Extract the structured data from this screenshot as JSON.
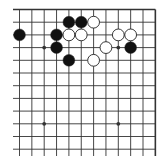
{
  "board": {
    "description": "Go board corner diagram (top-right region of a 19x19 board)",
    "columns": 12,
    "rows": 12,
    "open_left": true,
    "open_bottom": true,
    "colors": {
      "line": "#333333",
      "black_stone": "#111111",
      "white_stone": "#ffffff",
      "background": "#ffffff"
    },
    "star_points": [
      {
        "col": 2,
        "row": 3
      },
      {
        "col": 8,
        "row": 3
      },
      {
        "col": 2,
        "row": 9
      },
      {
        "col": 8,
        "row": 9
      }
    ],
    "stones": [
      {
        "color": "black",
        "col": 4,
        "row": 1
      },
      {
        "color": "black",
        "col": 5,
        "row": 1
      },
      {
        "color": "white",
        "col": 6,
        "row": 1
      },
      {
        "color": "black",
        "col": 0,
        "row": 2
      },
      {
        "color": "black",
        "col": 3,
        "row": 2
      },
      {
        "color": "white",
        "col": 4,
        "row": 2
      },
      {
        "color": "white",
        "col": 5,
        "row": 2
      },
      {
        "color": "white",
        "col": 8,
        "row": 2
      },
      {
        "color": "white",
        "col": 9,
        "row": 2
      },
      {
        "color": "black",
        "col": 3,
        "row": 3
      },
      {
        "color": "white",
        "col": 7,
        "row": 3
      },
      {
        "color": "black",
        "col": 9,
        "row": 3
      },
      {
        "color": "black",
        "col": 4,
        "row": 4
      },
      {
        "color": "white",
        "col": 6,
        "row": 4
      }
    ]
  }
}
